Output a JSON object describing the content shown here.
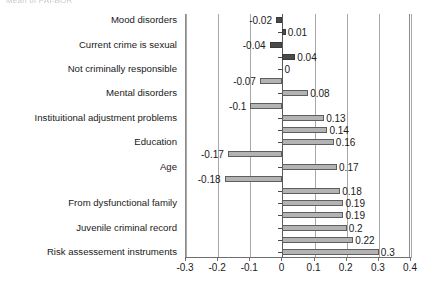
{
  "caption_fragment": "Mean of PAI-BOR",
  "chart_data": {
    "type": "bar",
    "orientation": "horizontal",
    "title": "",
    "xlabel": "",
    "ylabel": "",
    "xlim": [
      -0.3,
      0.4
    ],
    "grid": true,
    "legend": "none",
    "tick_labels": [
      "-0.3",
      "-0.2",
      "-0.1",
      "0",
      "0.1",
      "0.2",
      "0.3",
      "0.4"
    ],
    "tick_values": [
      -0.3,
      -0.2,
      -0.1,
      0,
      0.1,
      0.2,
      0.3,
      0.4
    ],
    "categories": [
      "Mood disorders",
      "Current crime is sexual",
      "Not criminally responsible",
      "Mental disorders",
      "Instituitional adjustment problems",
      "Education",
      "Age",
      "From dysfunctional family",
      "Juvenile criminal record",
      "Risk assessement instruments"
    ],
    "series": [
      {
        "name": "negative",
        "values": [
          -0.02,
          -0.04,
          -0.07,
          -0.1,
          null,
          -0.17,
          -0.18,
          null,
          null,
          null
        ],
        "labels": [
          "-0.02",
          "-0.04",
          "-0.07",
          "-0.1",
          "",
          "-0.17",
          "-0.18",
          "",
          "",
          ""
        ],
        "color": "#4a4a4a"
      },
      {
        "name": "positive",
        "values": [
          0.01,
          0.04,
          0,
          0.08,
          0.13,
          0.14,
          0.16,
          0.17,
          0.18,
          0.19
        ],
        "labels": [
          "0.01",
          "0.04",
          "0",
          "0.08",
          "0.13",
          "0.14",
          "0.16",
          "0.17",
          "0.18",
          "0.19"
        ],
        "color": "#b3b3b3"
      }
    ],
    "bars": [
      {
        "value": -0.02,
        "label": "-0.02",
        "style": "dark",
        "label_side": "left"
      },
      {
        "value": 0.01,
        "label": "0.01",
        "style": "dark",
        "label_side": "right"
      },
      {
        "value": -0.04,
        "label": "-0.04",
        "style": "dark",
        "label_side": "left"
      },
      {
        "value": 0.04,
        "label": "0.04",
        "style": "dark",
        "label_side": "right"
      },
      {
        "value": 0,
        "label": "0",
        "style": "zero",
        "label_side": "right"
      },
      {
        "value": -0.07,
        "label": "-0.07",
        "style": "light",
        "label_side": "left"
      },
      {
        "value": 0.08,
        "label": "0.08",
        "style": "light",
        "label_side": "right"
      },
      {
        "value": -0.1,
        "label": "-0.1",
        "style": "light",
        "label_side": "left"
      },
      {
        "value": 0.13,
        "label": "0.13",
        "style": "light",
        "label_side": "right"
      },
      {
        "value": 0.14,
        "label": "0.14",
        "style": "light",
        "label_side": "right"
      },
      {
        "value": 0.16,
        "label": "0.16",
        "style": "light",
        "label_side": "right"
      },
      {
        "value": -0.17,
        "label": "-0.17",
        "style": "light",
        "label_side": "left"
      },
      {
        "value": 0.17,
        "label": "0.17",
        "style": "light",
        "label_side": "right"
      },
      {
        "value": -0.18,
        "label": "-0.18",
        "style": "light",
        "label_side": "left"
      },
      {
        "value": 0.18,
        "label": "0.18",
        "style": "light",
        "label_side": "right"
      },
      {
        "value": 0.19,
        "label": "0.19",
        "style": "light",
        "label_side": "right"
      },
      {
        "value": 0.19,
        "label": "0.19",
        "style": "light",
        "label_side": "right"
      },
      {
        "value": 0.2,
        "label": "0.2",
        "style": "light",
        "label_side": "right"
      },
      {
        "value": 0.22,
        "label": "0.22",
        "style": "light",
        "label_side": "right"
      },
      {
        "value": 0.3,
        "label": "0.3",
        "style": "light",
        "label_side": "right"
      }
    ],
    "category_label_rows": [
      0,
      2,
      4,
      6,
      8,
      10,
      12,
      15,
      17,
      19
    ]
  }
}
